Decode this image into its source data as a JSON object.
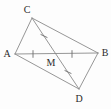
{
  "figure": {
    "kind": "geometry-diagram",
    "width": 111,
    "height": 109,
    "background_color": "#fdfdfd",
    "line_color": "#8a8a8a",
    "tick_color": "#6e6e6e",
    "label_color": "#2b2b2b",
    "points": [
      {
        "name": "A",
        "label": "A",
        "x": 15,
        "y": 54,
        "label_x": 7,
        "label_y": 54
      },
      {
        "name": "B",
        "label": "B",
        "x": 98,
        "y": 53,
        "label_x": 105,
        "label_y": 53
      },
      {
        "name": "C",
        "label": "C",
        "x": 32,
        "y": 18,
        "label_x": 27,
        "label_y": 10
      },
      {
        "name": "D",
        "label": "D",
        "x": 79,
        "y": 89,
        "label_x": 79,
        "label_y": 99
      },
      {
        "name": "M",
        "label": "M",
        "x": 56,
        "y": 54,
        "label_x": 51,
        "label_y": 63
      }
    ],
    "segments": [
      {
        "name": "AC",
        "from": "A",
        "to": "C"
      },
      {
        "name": "CB",
        "from": "C",
        "to": "B"
      },
      {
        "name": "AD",
        "from": "A",
        "to": "D"
      },
      {
        "name": "DB",
        "from": "D",
        "to": "B"
      },
      {
        "name": "AB",
        "from": "A",
        "to": "B"
      },
      {
        "name": "CD",
        "from": "C",
        "to": "D"
      }
    ],
    "tick_marks": [
      {
        "name": "tick-AM",
        "on": "AM",
        "x": 33,
        "y": 54,
        "angle": 90,
        "count": 1
      },
      {
        "name": "tick-MB",
        "on": "MB",
        "x": 72,
        "y": 54,
        "angle": 90,
        "count": 1
      },
      {
        "name": "tick-CM",
        "on": "CM",
        "x": 44,
        "y": 36,
        "angle": 25,
        "count": 1
      },
      {
        "name": "tick-MD",
        "on": "MD",
        "x": 68,
        "y": 72,
        "angle": 25,
        "count": 1
      }
    ]
  }
}
